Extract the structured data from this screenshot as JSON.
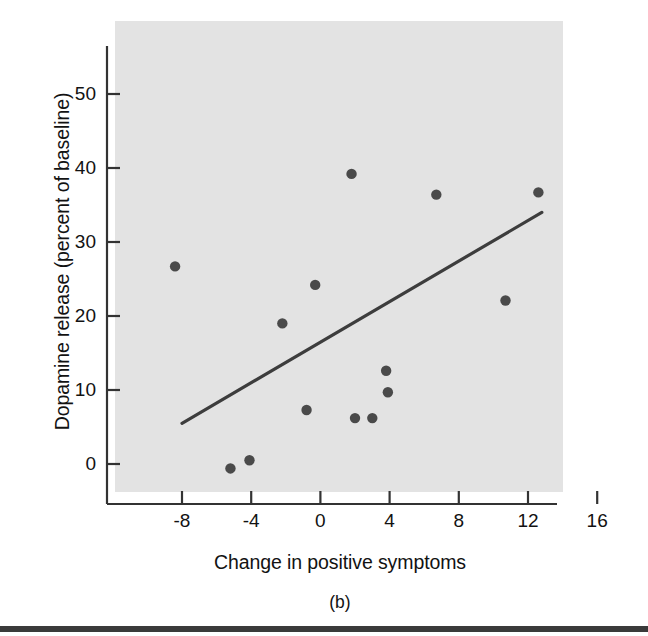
{
  "figure": {
    "caption": "(b)",
    "background_color": "#ffffff",
    "plot_background_color": "#e3e3e3",
    "axis_color": "#333333",
    "marker_color": "#4a4a4a",
    "line_color": "#3d3d3d",
    "rule_color": "#3a3a3a"
  },
  "axes": {
    "x_title": "Change in positive symptoms",
    "y_title": "Dopamine release (percent of baseline)",
    "x_ticks": [
      "-8",
      "-4",
      "0",
      "4",
      "8",
      "12",
      "16"
    ],
    "y_ticks": [
      "0",
      "10",
      "20",
      "30",
      "40",
      "50"
    ]
  },
  "chart_data": {
    "type": "scatter",
    "title": "(b)",
    "xlabel": "Change in positive symptoms",
    "ylabel": "Dopamine release (percent of baseline)",
    "xlim": [
      -10.5,
      16.8
    ],
    "ylim": [
      -3.5,
      56
    ],
    "xticks": [
      -8,
      -4,
      0,
      4,
      8,
      12,
      16
    ],
    "yticks": [
      0,
      10,
      20,
      30,
      40,
      50
    ],
    "grid": false,
    "legend": null,
    "series": [
      {
        "name": "Patients",
        "marker": "filled-circle",
        "points": [
          {
            "x": -8.4,
            "y": 26.7
          },
          {
            "x": -5.2,
            "y": -0.6
          },
          {
            "x": -4.1,
            "y": 0.5
          },
          {
            "x": -2.2,
            "y": 19.0
          },
          {
            "x": -0.8,
            "y": 7.3
          },
          {
            "x": -0.3,
            "y": 24.2
          },
          {
            "x": 1.8,
            "y": 39.2
          },
          {
            "x": 2.0,
            "y": 6.2
          },
          {
            "x": 3.0,
            "y": 6.2
          },
          {
            "x": 3.8,
            "y": 12.6
          },
          {
            "x": 3.9,
            "y": 9.7
          },
          {
            "x": 6.7,
            "y": 36.4
          },
          {
            "x": 10.7,
            "y": 22.1
          },
          {
            "x": 12.6,
            "y": 36.7
          }
        ]
      }
    ],
    "fit_line": {
      "name": "regression line",
      "x_start": -8.0,
      "y_start": 5.5,
      "x_end": 12.8,
      "y_end": 34.0
    }
  }
}
